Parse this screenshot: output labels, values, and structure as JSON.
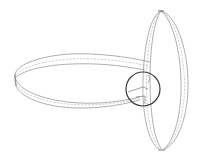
{
  "figure": {
    "colors": {
      "background": "#ffffff",
      "outline": "#9a9a9a",
      "dashed": "#b5b5b5",
      "detail_circle": "#3a3a3a"
    },
    "elements": [
      {
        "name": "horizontal-ring",
        "type": "band-ring",
        "orientation": "horizontal"
      },
      {
        "name": "vertical-ring",
        "type": "band-ring",
        "orientation": "vertical"
      },
      {
        "name": "detail-circle",
        "type": "highlight-circle"
      }
    ]
  }
}
